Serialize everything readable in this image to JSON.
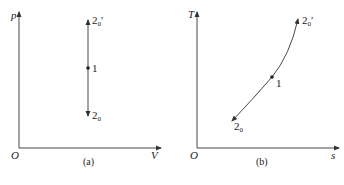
{
  "figure": {
    "panels": [
      {
        "id": "a",
        "caption": "(a)",
        "y_axis_label": "p",
        "x_axis_label": "V",
        "origin_label": "O",
        "process": "vertical line (constant volume) through state 1",
        "points": [
          {
            "label_main": "2",
            "label_sub": "0",
            "label_prime": "′",
            "position": "top"
          },
          {
            "label_main": "1",
            "position": "middle"
          },
          {
            "label_main": "2",
            "label_sub": "0",
            "position": "bottom"
          }
        ]
      },
      {
        "id": "b",
        "caption": "(b)",
        "y_axis_label": "T",
        "x_axis_label": "s",
        "origin_label": "O",
        "process": "rising curve (isochore on T-s) through state 1",
        "points": [
          {
            "label_main": "2",
            "label_sub": "0",
            "label_prime": "′",
            "position": "top-right"
          },
          {
            "label_main": "1",
            "position": "middle"
          },
          {
            "label_main": "2",
            "label_sub": "0",
            "position": "bottom-left"
          }
        ]
      }
    ]
  },
  "colors": {
    "line": "#333333",
    "background": "#ffffff"
  }
}
